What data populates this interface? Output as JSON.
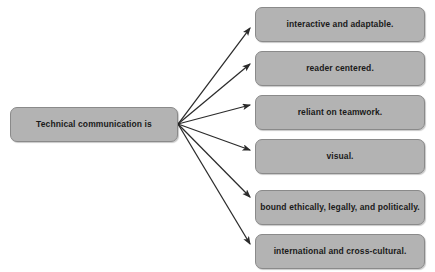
{
  "diagram": {
    "title": "Technical communication is",
    "source": {
      "label": "Technical communication is"
    },
    "targets": [
      {
        "label": "interactive and adaptable."
      },
      {
        "label": "reader centered."
      },
      {
        "label": "reliant on teamwork."
      },
      {
        "label": "visual."
      },
      {
        "label": "bound ethically, legally, and politically."
      },
      {
        "label": "international and cross-cultural."
      }
    ],
    "colors": {
      "box_fill": "#b3b3b3",
      "box_border": "#8a8a8a",
      "text": "#1a1a1a",
      "arrow": "#2b2b2b",
      "background": "#ffffff"
    },
    "connectors": {
      "type": "arrow",
      "origin_x": 178,
      "origin_y": 124,
      "count": 6
    }
  }
}
